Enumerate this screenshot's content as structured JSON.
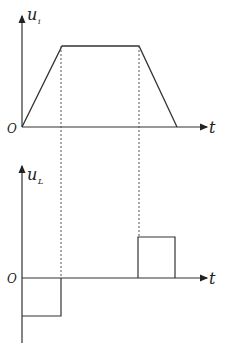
{
  "diagram": {
    "top_graph": {
      "y_label": "u",
      "y_label_sub": "i",
      "x_label": "t",
      "origin_label": "O",
      "waveform": "trapezoid",
      "points": [
        [
          22,
          127
        ],
        [
          62,
          46
        ],
        [
          139,
          46
        ],
        [
          177,
          127
        ]
      ]
    },
    "bottom_graph": {
      "y_label": "u",
      "y_label_sub": "L",
      "x_label": "t",
      "origin_label": "O",
      "waveform": "square pulses",
      "negative_pulse": {
        "x_start": 22,
        "x_end": 61,
        "level": 316
      },
      "positive_pulse": {
        "x_start": 138,
        "x_end": 175,
        "level": 237
      }
    },
    "dotted_guides_x": [
      61,
      139
    ],
    "colors": {
      "line": "#333333",
      "guide": "#555555"
    }
  }
}
